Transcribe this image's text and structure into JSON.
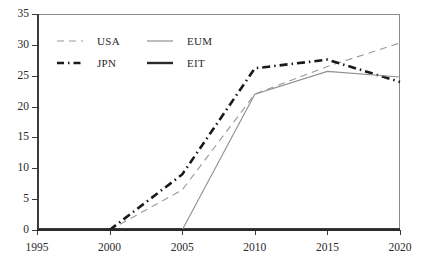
{
  "chart_data": {
    "type": "line",
    "title": "",
    "xlabel": "",
    "ylabel": "",
    "xlim": [
      1995,
      2020
    ],
    "ylim": [
      0,
      35
    ],
    "x": [
      1995,
      2000,
      2005,
      2010,
      2015,
      2020
    ],
    "xtick_labels": [
      "1995",
      "2000",
      "2005",
      "2010",
      "2015",
      "2020"
    ],
    "ytick_labels": [
      "0",
      "5",
      "10",
      "15",
      "20",
      "25",
      "30",
      "35"
    ],
    "ytick_values": [
      0,
      5,
      10,
      15,
      20,
      25,
      30,
      35
    ],
    "grid": false,
    "legend_position": "upper-left",
    "series": [
      {
        "name": "USA",
        "style": "dashed-thin",
        "color": "#9a9a9a",
        "x": [
          2000,
          2005,
          2010,
          2015,
          2020
        ],
        "values": [
          0,
          6.5,
          22.0,
          26.5,
          30.3
        ]
      },
      {
        "name": "JPN",
        "style": "dashdot-thick",
        "color": "#1a1a1a",
        "x": [
          2000,
          2005,
          2010,
          2015,
          2020
        ],
        "values": [
          0,
          9.0,
          26.2,
          27.6,
          24.0
        ]
      },
      {
        "name": "EUM",
        "style": "solid-thin",
        "color": "#8f8f8f",
        "x": [
          2005,
          2010,
          2015,
          2020
        ],
        "values": [
          0,
          22.0,
          25.7,
          24.8
        ]
      },
      {
        "name": "EIT",
        "style": "solid-thick",
        "color": "#2a2a2a",
        "x": [
          1995,
          2020
        ],
        "values": [
          0,
          0
        ]
      }
    ]
  },
  "legend": {
    "rows": [
      [
        {
          "label": "USA",
          "swatch": "dashed-thin-swatch"
        },
        {
          "label": "EUM",
          "swatch": "solid-thin-swatch"
        }
      ],
      [
        {
          "label": "JPN",
          "swatch": "dashdot-thick-swatch"
        },
        {
          "label": "EIT",
          "swatch": "solid-thick-swatch"
        }
      ]
    ]
  }
}
